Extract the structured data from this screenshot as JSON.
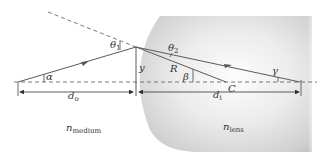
{
  "diagram": {
    "type": "refraction-at-spherical-surface",
    "colors": {
      "ray": "#5a5a5a",
      "dashed": "#6a6a6a",
      "lens_light": "#fafafa",
      "lens_dark": "#bdbdbd",
      "text": "#333333"
    },
    "labels": {
      "theta1": {
        "base": "θ",
        "sub": "1"
      },
      "theta2": {
        "base": "θ",
        "sub": "2"
      },
      "alpha": "α",
      "beta": "β",
      "gamma": "γ",
      "y": "y",
      "R": "R",
      "C": "C",
      "d_o": {
        "base": "d",
        "sub": "o"
      },
      "d_i": {
        "base": "d",
        "sub": "i"
      },
      "n_medium": {
        "base": "n",
        "sub": "medium"
      },
      "n_lens": {
        "base": "n",
        "sub": "lens"
      }
    },
    "regions": [
      "medium",
      "lens"
    ]
  }
}
